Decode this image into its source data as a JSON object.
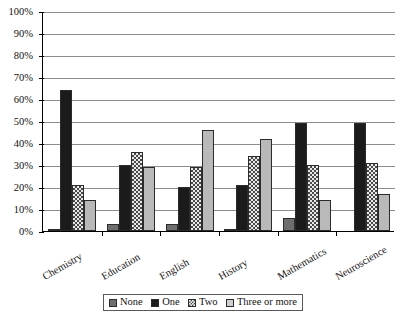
{
  "chart_data": {
    "type": "bar",
    "title": "",
    "xlabel": "",
    "ylabel": "",
    "ylim": [
      0,
      100
    ],
    "ytick_labels": [
      "0%",
      "10%",
      "20%",
      "30%",
      "40%",
      "50%",
      "60%",
      "70%",
      "80%",
      "90%",
      "100%"
    ],
    "ytick_values": [
      0,
      10,
      20,
      30,
      40,
      50,
      60,
      70,
      80,
      90,
      100
    ],
    "grid": true,
    "legend_position": "bottom",
    "categories": [
      "Chemistry",
      "Education",
      "English",
      "History",
      "Mathematics",
      "Neuroscience"
    ],
    "series": [
      {
        "name": "None",
        "color": "#6e6e6e",
        "values": [
          1,
          3,
          3,
          1,
          6,
          0
        ]
      },
      {
        "name": "One",
        "color": "#1b1b1b",
        "values": [
          64,
          30,
          20,
          21,
          49,
          49
        ]
      },
      {
        "name": "Two",
        "color": "#4a4a4a",
        "values": [
          21,
          36,
          29,
          34,
          30,
          31
        ]
      },
      {
        "name": "Three or more",
        "color": "#b9b9b9",
        "values": [
          14,
          29,
          46,
          42,
          14,
          17
        ]
      }
    ]
  },
  "legend": {
    "items": [
      {
        "label": "None"
      },
      {
        "label": "One"
      },
      {
        "label": "Two"
      },
      {
        "label": "Three or more"
      }
    ]
  }
}
